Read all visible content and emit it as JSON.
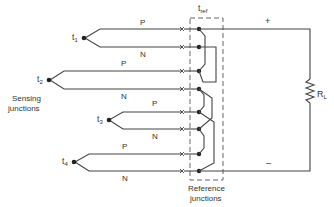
{
  "diagram": {
    "type": "thermocouple-circuit",
    "labels": {
      "tref_main": "t",
      "tref_sub": "ref",
      "plus": "+",
      "minus": "–",
      "load_main": "R",
      "load_sub": "L",
      "sensing_line1": "Sensing",
      "sensing_line2": "junctions",
      "reference_line1": "Reference",
      "reference_line2": "junctions"
    },
    "junctions": [
      {
        "name": "t",
        "sub": "1",
        "p_label": "P",
        "n_label": "N"
      },
      {
        "name": "t",
        "sub": "2",
        "p_label": "P",
        "n_label": "N"
      },
      {
        "name": "t",
        "sub": "3",
        "p_label": "P",
        "n_label": "N"
      },
      {
        "name": "t",
        "sub": "4",
        "p_label": "P",
        "n_label": "N"
      }
    ],
    "colors": {
      "line": "#444444",
      "text": "#333333",
      "background": "#ffffff"
    }
  }
}
